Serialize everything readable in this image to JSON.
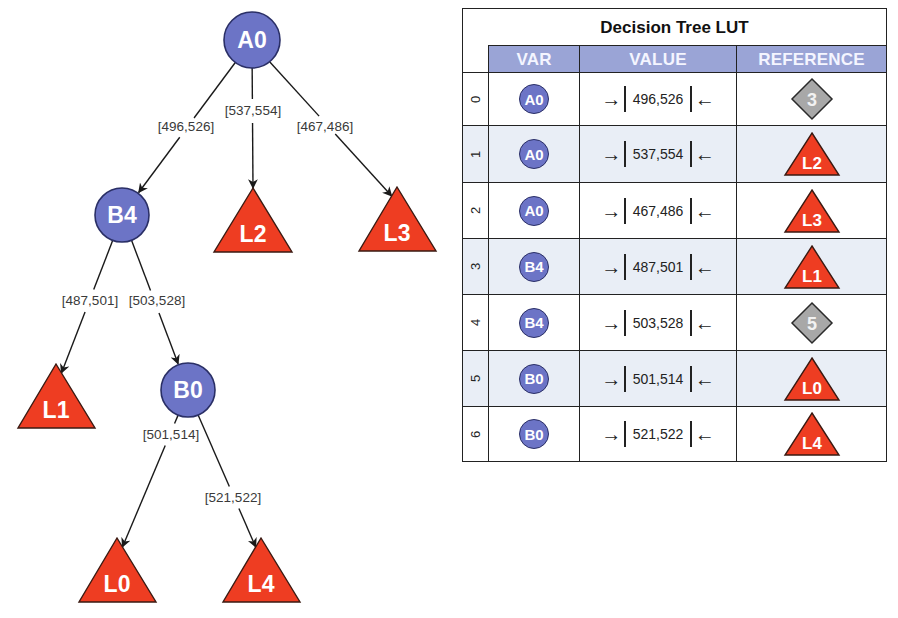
{
  "colors": {
    "var_node_fill": "#6c74c6",
    "var_node_stroke": "#2a2f66",
    "leaf_fill": "#ee3d22",
    "leaf_stroke": "#3a1a12",
    "ref_diamond_fill": "#a8a8a8",
    "header_fill": "#9aa4d6",
    "row_tint": "#e9eef6"
  },
  "tree": {
    "nodes": [
      {
        "id": "A0",
        "label": "A0",
        "type": "var",
        "cx": 252,
        "cy": 40,
        "r": 28
      },
      {
        "id": "B4",
        "label": "B4",
        "type": "var",
        "cx": 122,
        "cy": 215,
        "r": 27
      },
      {
        "id": "B0",
        "label": "B0",
        "type": "var",
        "cx": 188,
        "cy": 390,
        "r": 27
      },
      {
        "id": "L2",
        "label": "L2",
        "type": "leaf",
        "apex": [
          253,
          188
        ],
        "base": [
          214,
          292,
          252
        ]
      },
      {
        "id": "L3",
        "label": "L3",
        "type": "leaf",
        "apex": [
          397,
          187
        ],
        "base": [
          359,
          436,
          251
        ]
      },
      {
        "id": "L1",
        "label": "L1",
        "type": "leaf",
        "apex": [
          56,
          364
        ],
        "base": [
          18,
          95,
          428
        ]
      },
      {
        "id": "L0",
        "label": "L0",
        "type": "leaf",
        "apex": [
          117,
          538
        ],
        "base": [
          79,
          156,
          602
        ]
      },
      {
        "id": "L4",
        "label": "L4",
        "type": "leaf",
        "apex": [
          261,
          538
        ],
        "base": [
          223,
          300,
          602
        ]
      }
    ],
    "edges": [
      {
        "from": "A0",
        "to": "B4",
        "label": "[496,526]",
        "lx": 186,
        "ly": 131
      },
      {
        "from": "A0",
        "to": "L2",
        "label": "[537,554]",
        "lx": 253,
        "ly": 115
      },
      {
        "from": "A0",
        "to": "L3",
        "label": "[467,486]",
        "lx": 325,
        "ly": 131
      },
      {
        "from": "B4",
        "to": "L1",
        "label": "[487,501]",
        "lx": 90,
        "ly": 305
      },
      {
        "from": "B4",
        "to": "B0",
        "label": "[503,528]",
        "lx": 157,
        "ly": 305
      },
      {
        "from": "B0",
        "to": "L0",
        "label": "[501,514]",
        "lx": 171,
        "ly": 439
      },
      {
        "from": "B0",
        "to": "L4",
        "label": "[521,522]",
        "lx": 233,
        "ly": 502
      }
    ]
  },
  "lut": {
    "title": "Decision Tree LUT",
    "headers": {
      "var": "VAR",
      "value": "VALUE",
      "reference": "REFERENCE"
    },
    "arrow_left": "→",
    "arrow_right": "←",
    "rows": [
      {
        "index": "0",
        "var": "A0",
        "value": "496,526",
        "ref_type": "diamond",
        "ref": "3"
      },
      {
        "index": "1",
        "var": "A0",
        "value": "537,554",
        "ref_type": "leaf",
        "ref": "L2"
      },
      {
        "index": "2",
        "var": "A0",
        "value": "467,486",
        "ref_type": "leaf",
        "ref": "L3"
      },
      {
        "index": "3",
        "var": "B4",
        "value": "487,501",
        "ref_type": "leaf",
        "ref": "L1"
      },
      {
        "index": "4",
        "var": "B4",
        "value": "503,528",
        "ref_type": "diamond",
        "ref": "5"
      },
      {
        "index": "5",
        "var": "B0",
        "value": "501,514",
        "ref_type": "leaf",
        "ref": "L0"
      },
      {
        "index": "6",
        "var": "B0",
        "value": "521,522",
        "ref_type": "leaf",
        "ref": "L4"
      }
    ]
  }
}
